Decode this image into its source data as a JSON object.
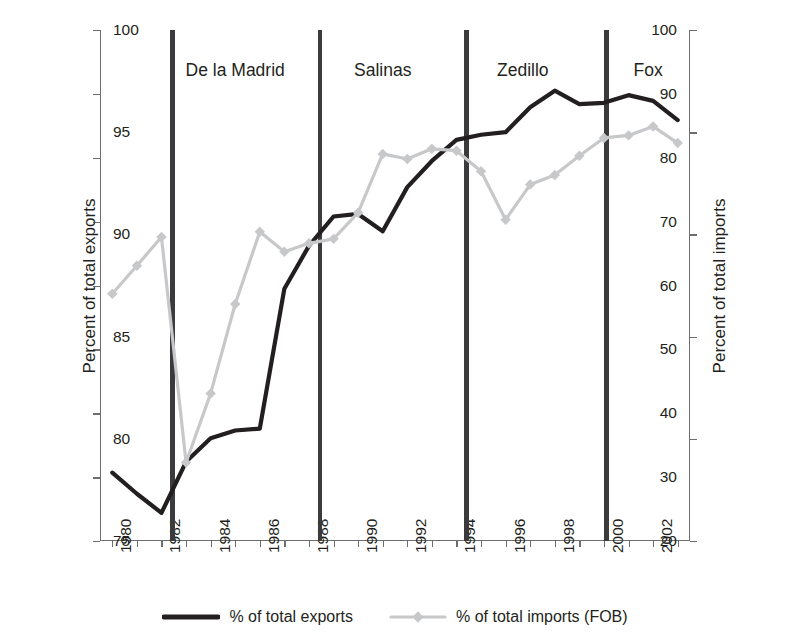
{
  "chart_data": {
    "type": "line",
    "title": "",
    "xlabel": "",
    "ylabel": "Percent of total exports",
    "ylabel_right": "Percent of total imports",
    "xlim": [
      1979.5,
      2003.5
    ],
    "ylim": [
      20,
      100
    ],
    "ylim_right": [
      75,
      100
    ],
    "grid": false,
    "legend_position": "bottom-center",
    "x": [
      1980,
      1981,
      1982,
      1983,
      1984,
      1985,
      1986,
      1987,
      1988,
      1989,
      1990,
      1991,
      1992,
      1993,
      1994,
      1995,
      1996,
      1997,
      1998,
      1999,
      2000,
      2001,
      2002,
      2003
    ],
    "yticks_left": [
      20,
      30,
      40,
      50,
      60,
      70,
      80,
      90,
      100
    ],
    "yticks_right": [
      75,
      80,
      85,
      90,
      95,
      100
    ],
    "xticks": [
      1980,
      1982,
      1984,
      1986,
      1988,
      1990,
      1992,
      1994,
      1996,
      1998,
      2000,
      2002
    ],
    "xtick_labels": [
      "1980",
      "1982",
      "1984",
      "1986",
      "1988",
      "1990",
      "1992",
      "1994",
      "1996",
      "1998",
      "2000",
      "2002"
    ],
    "series": [
      {
        "name": "% of total exports",
        "axis": "left",
        "color": "#231f20",
        "marker": "none",
        "line_width": 4.2,
        "values": [
          30.7,
          27.4,
          24.4,
          32.4,
          36.1,
          37.3,
          37.6,
          59.5,
          66.2,
          70.8,
          71.2,
          68.5,
          75.4,
          79.5,
          82.8,
          83.6,
          84.0,
          87.9,
          90.5,
          88.4,
          88.6,
          89.8,
          88.9,
          85.9
        ]
      },
      {
        "name": "% of total imports (FOB)",
        "axis": "right",
        "color": "#c7c8ca",
        "marker": "diamond",
        "line_width": 3.2,
        "values_left_scale": [
          58.7,
          63.1,
          67.6,
          32.3,
          43.1,
          57.1,
          68.4,
          65.3,
          66.6,
          67.3,
          71.4,
          80.6,
          79.8,
          81.4,
          81.1,
          77.9,
          70.3,
          75.8,
          77.3,
          80.3,
          83.1,
          83.5,
          84.9,
          82.3
        ],
        "values": [
          87.1,
          88.5,
          89.9,
          78.8,
          82.2,
          86.6,
          90.1,
          89.2,
          89.6,
          89.8,
          91.1,
          94.0,
          93.7,
          94.2,
          94.1,
          93.1,
          90.7,
          92.4,
          92.9,
          93.8,
          94.7,
          94.8,
          95.3,
          94.5
        ]
      }
    ],
    "annotations": [
      {
        "label": "De la Madrid",
        "x_center": 1985.0,
        "divider_before": 1982.45,
        "divider_after": 1988.45
      },
      {
        "label": "Salinas",
        "x_center": 1991.0,
        "divider_before": 1988.45,
        "divider_after": 1994.4
      },
      {
        "label": "Zedillo",
        "x_center": 1996.7,
        "divider_before": 1994.4,
        "divider_after": 2000.1
      },
      {
        "label": "Fox",
        "x_center": 2001.8,
        "divider_before": 2000.1,
        "divider_after": null
      }
    ],
    "dividers": [
      1982.45,
      1988.45,
      1994.4,
      2000.1
    ]
  },
  "legend": {
    "items": [
      {
        "label": "% of total exports",
        "color": "#231f20",
        "marker": "none"
      },
      {
        "label": "% of total imports (FOB)",
        "color": "#c7c8ca",
        "marker": "diamond"
      }
    ]
  }
}
